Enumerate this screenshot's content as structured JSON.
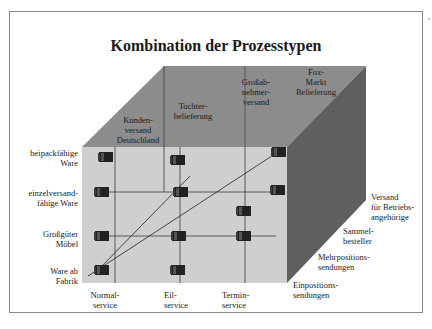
{
  "title": "Kombination der Prozesstypen",
  "colors": {
    "top_face": "#8c8c8c",
    "front_face": "#cfcfcf",
    "right_face": "#5f5f5f",
    "box": "#2a2a2a",
    "grid_line": "#3a3a3a",
    "frame": "#8a8a8a"
  },
  "top_axis_labels": [
    {
      "line1": "Kunden-",
      "line2": "versand",
      "line3": "Deutschland"
    },
    {
      "line1": "Tochter-",
      "line2": "belieferung"
    },
    {
      "line1": "Großab-",
      "line2": "nehmer-",
      "line3": "versand"
    },
    {
      "line1": "Fox-",
      "line2": "Markt",
      "line3": "Belieferung"
    }
  ],
  "left_axis_labels": [
    {
      "line1": "beipackfähige",
      "line2": "Ware"
    },
    {
      "line1": "einzelversand-",
      "line2": "fähige Ware"
    },
    {
      "line1": "Großgüter",
      "line2": "Möbel"
    },
    {
      "line1": "Ware ab",
      "line2": "Fabrik"
    }
  ],
  "bottom_axis_labels": [
    {
      "line1": "Normal-",
      "line2": "service"
    },
    {
      "line1": "Eil-",
      "line2": "service"
    },
    {
      "line1": "Termin-",
      "line2": "service"
    }
  ],
  "depth_axis_labels": [
    {
      "line1": "Einpositions-",
      "line2": "sendungen"
    },
    {
      "line1": "Mehrpositions-",
      "line2": "sendungen"
    },
    {
      "line1": "Sammel-",
      "line2": "besteller"
    },
    {
      "line1": "Versand",
      "line2": "für Betriebs-",
      "line3": "angehörige"
    }
  ]
}
